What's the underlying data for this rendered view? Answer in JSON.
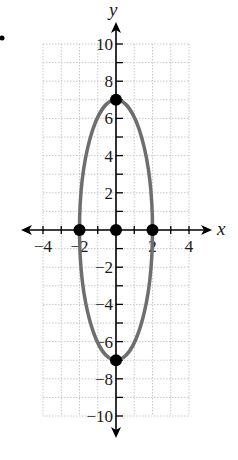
{
  "chart_data": {
    "type": "scatter",
    "title": "",
    "xlabel": "x",
    "ylabel": "y",
    "xlim": [
      -4,
      4
    ],
    "ylim": [
      -10,
      10
    ],
    "grid": true,
    "x_ticks": [
      -4,
      -2,
      2,
      4
    ],
    "x_tick_labels": [
      "−4",
      "−2",
      "2",
      "4"
    ],
    "y_ticks": [
      -10,
      -8,
      -6,
      -4,
      -2,
      2,
      4,
      6,
      8,
      10
    ],
    "y_tick_labels": [
      "−10",
      "−8",
      "−6",
      "−4",
      "−2",
      "2",
      "4",
      "6",
      "8",
      "10"
    ],
    "curve": {
      "shape": "ellipse",
      "center": [
        0,
        0
      ],
      "semi_axis_x": 2,
      "semi_axis_y": 7,
      "equation": "x^2/4 + y^2/49 = 1"
    },
    "points": [
      {
        "label": "center",
        "x": 0,
        "y": 0
      },
      {
        "label": "vertex-top",
        "x": 0,
        "y": 7
      },
      {
        "label": "vertex-bottom",
        "x": 0,
        "y": -7
      },
      {
        "label": "co-vertex-left",
        "x": -2,
        "y": 0
      },
      {
        "label": "co-vertex-right",
        "x": 2,
        "y": 0
      }
    ],
    "colors": {
      "curve": "#6e6e6e",
      "points": "#000000",
      "axes": "#000000",
      "grid": "#c8c8c8"
    }
  },
  "marker": "•"
}
